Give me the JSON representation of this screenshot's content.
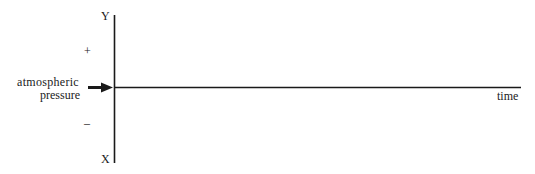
{
  "diagram": {
    "y_axis_top_label": "Y",
    "y_axis_bottom_label": "X",
    "plus_sign": "+",
    "minus_sign": "–",
    "pointer_label_line1": "atmospheric",
    "pointer_label_line2": "pressure",
    "x_axis_label": "time",
    "pointer_icon": "arrow-right-icon",
    "line_color": "#1a1a1a"
  }
}
